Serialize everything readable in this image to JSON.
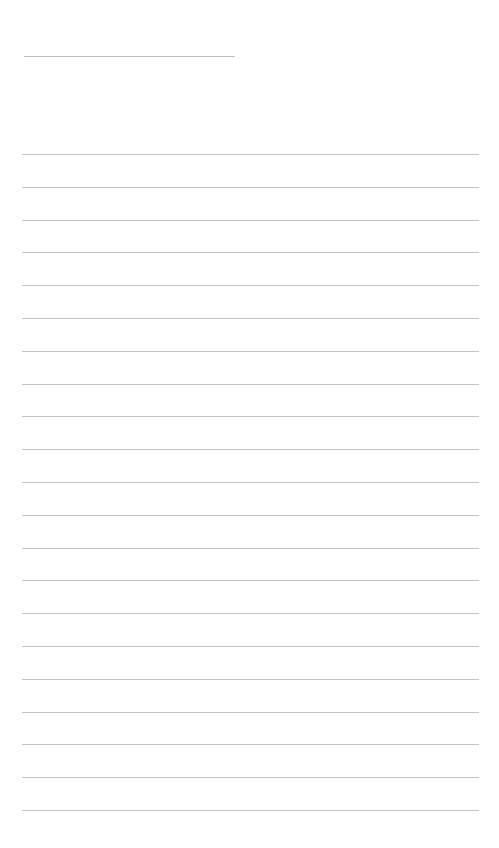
{
  "page": {
    "type": "lined-writing-sheet",
    "background_color": "#ffffff",
    "line_color": "#c4c4c4",
    "title_line": {
      "x": 24,
      "y": 56,
      "width": 211,
      "text": ""
    },
    "ruled_lines": {
      "count": 21,
      "x": 22,
      "width": 457,
      "first_y": 154,
      "spacing": 32.8,
      "texts": [
        "",
        "",
        "",
        "",
        "",
        "",
        "",
        "",
        "",
        "",
        "",
        "",
        "",
        "",
        "",
        "",
        "",
        "",
        "",
        "",
        ""
      ]
    }
  }
}
